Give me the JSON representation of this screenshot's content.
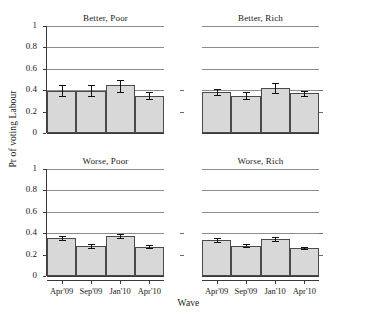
{
  "chart_data": {
    "type": "bar",
    "title": "",
    "xlabel": "Wave",
    "ylabel": "Pr of voting Labour",
    "ylim": [
      0,
      1
    ],
    "yticks": [
      0,
      0.2,
      0.4,
      0.6,
      0.8,
      1
    ],
    "ytick_labels": [
      "0",
      "0.2",
      "0.4",
      "0.6",
      "0.8",
      "1"
    ],
    "grid": "horizontal",
    "legend": "none",
    "layout": "2x2 facet grid",
    "categories": [
      "Apr'09",
      "Sep'09",
      "Jan'10",
      "Apr'10"
    ],
    "panels": [
      {
        "title": "Better, Poor",
        "row": 0,
        "col": 0,
        "values": [
          0.395,
          0.395,
          0.445,
          0.35
        ],
        "ci_low": [
          0.35,
          0.35,
          0.385,
          0.32
        ],
        "ci_high": [
          0.445,
          0.445,
          0.5,
          0.385
        ]
      },
      {
        "title": "Better, Rich",
        "row": 0,
        "col": 1,
        "values": [
          0.385,
          0.35,
          0.42,
          0.37
        ],
        "ci_low": [
          0.355,
          0.315,
          0.375,
          0.35
        ],
        "ci_high": [
          0.415,
          0.385,
          0.465,
          0.39
        ]
      },
      {
        "title": "Worse, Poor",
        "row": 1,
        "col": 0,
        "values": [
          0.355,
          0.28,
          0.375,
          0.275
        ],
        "ci_low": [
          0.335,
          0.265,
          0.355,
          0.262
        ],
        "ci_high": [
          0.375,
          0.297,
          0.392,
          0.29
        ]
      },
      {
        "title": "Worse, Rich",
        "row": 1,
        "col": 1,
        "values": [
          0.335,
          0.285,
          0.345,
          0.26
        ],
        "ci_low": [
          0.318,
          0.272,
          0.328,
          0.248
        ],
        "ci_high": [
          0.352,
          0.298,
          0.362,
          0.272
        ]
      }
    ],
    "colors": {
      "bar_fill": "#d8d8d8",
      "bar_stroke": "#4a4a4a",
      "error_bar": "#111111",
      "gridline": "#8c8c8c",
      "axis": "#3a3a3a",
      "background": "#ffffff"
    }
  }
}
